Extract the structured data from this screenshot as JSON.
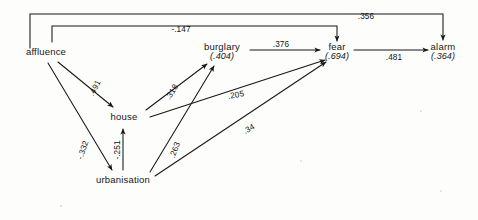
{
  "diagram": {
    "type": "path-diagram",
    "title": "",
    "nodes": [
      {
        "id": "affluence",
        "label": "affluence",
        "r2": "",
        "x": 46,
        "y": 52
      },
      {
        "id": "burglary",
        "label": "burglary",
        "r2": "(.404)",
        "x": 222,
        "y": 52
      },
      {
        "id": "fear",
        "label": "fear",
        "r2": "(.694)",
        "x": 337,
        "y": 52
      },
      {
        "id": "alarm",
        "label": "alarm",
        "r2": "(.364)",
        "x": 443,
        "y": 52
      },
      {
        "id": "house",
        "label": "house",
        "r2": "",
        "x": 124,
        "y": 117
      },
      {
        "id": "urbanisation",
        "label": "urbanisation",
        "r2": "",
        "x": 123,
        "y": 180
      }
    ],
    "edges": [
      {
        "id": "affluence-alarm",
        "from": "affluence",
        "to": "alarm",
        "coefficient": ".356",
        "label_x": 366,
        "label_y": 16,
        "rotate": 0
      },
      {
        "id": "affluence-fear",
        "from": "affluence",
        "to": "fear",
        "coefficient": "-.147",
        "label_x": 181,
        "label_y": 29,
        "rotate": 0
      },
      {
        "id": "burglary-fear",
        "from": "burglary",
        "to": "fear",
        "coefficient": ".376",
        "label_x": 281,
        "label_y": 51,
        "rotate": 0
      },
      {
        "id": "fear-alarm",
        "from": "fear",
        "to": "alarm",
        "coefficient": ".481",
        "label_x": 394,
        "label_y": 51,
        "rotate": 0
      },
      {
        "id": "affluence-house",
        "from": "affluence",
        "to": "house",
        "coefficient": ".491",
        "label_x": 95,
        "label_y": 88,
        "rotate": -62
      },
      {
        "id": "house-burglary",
        "from": "house",
        "to": "burglary",
        "coefficient": ".318",
        "label_x": 172,
        "label_y": 92,
        "rotate": -58
      },
      {
        "id": "house-fear",
        "from": "house",
        "to": "fear",
        "coefficient": ".205",
        "label_x": 236,
        "label_y": 95,
        "rotate": -10
      },
      {
        "id": "urbanisation-house",
        "from": "urbanisation",
        "to": "house",
        "coefficient": "-.251",
        "label_x": 117,
        "label_y": 150,
        "rotate": -90
      },
      {
        "id": "affluence-urbanisation",
        "from": "affluence",
        "to": "urbanisation",
        "coefficient": "-.332",
        "label_x": 83,
        "label_y": 150,
        "rotate": -71
      },
      {
        "id": "urbanisation-burglary",
        "from": "urbanisation",
        "to": "burglary",
        "coefficient": ".263",
        "label_x": 175,
        "label_y": 150,
        "rotate": -70
      },
      {
        "id": "urbanisation-fear",
        "from": "urbanisation",
        "to": "fear",
        "coefficient": ".34",
        "label_x": 249,
        "label_y": 129,
        "rotate": -30
      }
    ],
    "colors": {
      "ink": "#171717",
      "paper": "#fdfdfc"
    }
  }
}
